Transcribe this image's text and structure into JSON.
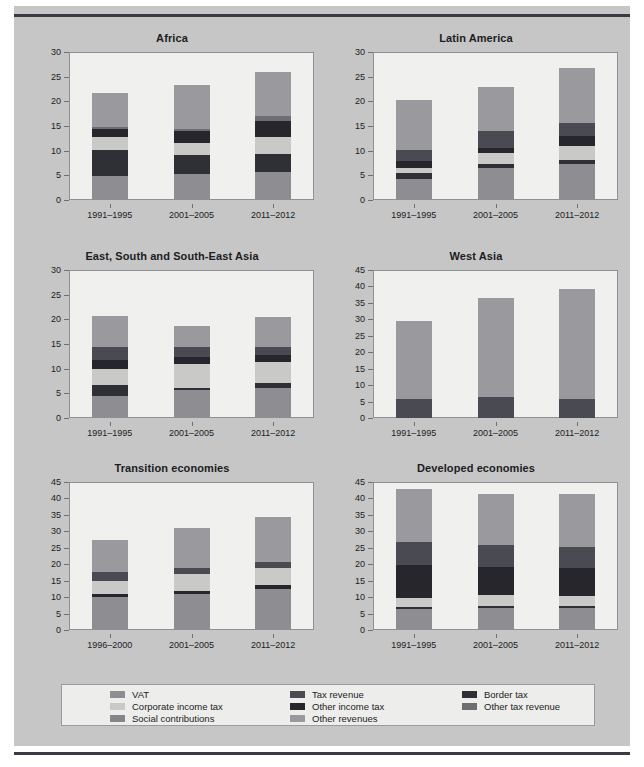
{
  "colors": {
    "page_background": "#c6c6c6",
    "plot_background": "#f0f0ee",
    "legend_background": "#ededeb",
    "rule": "#3b3b45",
    "vat": "#8e8e92",
    "corporate_income_tax": "#c9c9c7",
    "social_contributions": "#84848a",
    "tax_revenue": "#4a4a52",
    "other_income_tax": "#26262c",
    "other_revenues": "#9a9a9e",
    "border_tax": "#2f2f36",
    "other_tax_revenue": "#6d6d74"
  },
  "legend": {
    "columns": [
      [
        {
          "label": "VAT",
          "key": "vat"
        },
        {
          "label": "Corporate income tax",
          "key": "corporate_income_tax"
        },
        {
          "label": "Social contributions",
          "key": "social_contributions"
        }
      ],
      [
        {
          "label": "Tax revenue",
          "key": "tax_revenue"
        },
        {
          "label": "Other income tax",
          "key": "other_income_tax"
        },
        {
          "label": "Other revenues",
          "key": "other_revenues"
        }
      ],
      [
        {
          "label": "Border tax",
          "key": "border_tax"
        },
        {
          "label": "Other tax revenue",
          "key": "other_tax_revenue"
        }
      ]
    ]
  },
  "chart_data": [
    {
      "type": "bar",
      "stacked": true,
      "title": "Africa",
      "xlabel": "",
      "ylabel": "",
      "ylim": [
        0,
        30
      ],
      "yticks": [
        0,
        5,
        10,
        15,
        20,
        25,
        30
      ],
      "grid": false,
      "categories": [
        "1991–1995",
        "2001–2005",
        "2011–2012"
      ],
      "series": [
        {
          "name": "VAT",
          "key": "vat",
          "values": [
            4.8,
            5.2,
            5.6
          ]
        },
        {
          "name": "Border tax",
          "key": "border_tax",
          "values": [
            5.3,
            4.0,
            3.8
          ]
        },
        {
          "name": "Corporate income tax",
          "key": "corporate_income_tax",
          "values": [
            2.7,
            2.4,
            3.4
          ]
        },
        {
          "name": "Other income tax",
          "key": "other_income_tax",
          "values": [
            1.5,
            2.3,
            3.2
          ]
        },
        {
          "name": "Other tax revenue",
          "key": "other_tax_revenue",
          "values": [
            0.5,
            0.6,
            1.0
          ]
        },
        {
          "name": "Other revenues",
          "key": "other_revenues",
          "values": [
            7.0,
            8.8,
            9.0
          ]
        }
      ],
      "totals": [
        21.8,
        23.3,
        26.0
      ]
    },
    {
      "type": "bar",
      "stacked": true,
      "title": "Latin America",
      "xlabel": "",
      "ylabel": "",
      "ylim": [
        0,
        30
      ],
      "yticks": [
        0,
        5,
        10,
        15,
        20,
        25,
        30
      ],
      "grid": false,
      "categories": [
        "1991–1995",
        "2001–2005",
        "2011–2012"
      ],
      "series": [
        {
          "name": "VAT",
          "key": "vat",
          "values": [
            4.3,
            6.5,
            7.2
          ]
        },
        {
          "name": "Border tax",
          "key": "border_tax",
          "values": [
            1.2,
            0.8,
            0.9
          ]
        },
        {
          "name": "Corporate income tax",
          "key": "corporate_income_tax",
          "values": [
            1.0,
            2.2,
            2.8
          ]
        },
        {
          "name": "Other income tax",
          "key": "other_income_tax",
          "values": [
            1.5,
            1.0,
            2.0
          ]
        },
        {
          "name": "Tax revenue",
          "key": "tax_revenue",
          "values": [
            2.2,
            3.5,
            2.8
          ]
        },
        {
          "name": "Other revenues",
          "key": "other_revenues",
          "values": [
            10.0,
            9.0,
            11.1
          ]
        }
      ],
      "totals": [
        20.2,
        23.0,
        26.8
      ]
    },
    {
      "type": "bar",
      "stacked": true,
      "title": "East, South and South-East Asia",
      "xlabel": "",
      "ylabel": "",
      "ylim": [
        0,
        30
      ],
      "yticks": [
        0,
        5,
        10,
        15,
        20,
        25,
        30
      ],
      "grid": false,
      "categories": [
        "1991–1995",
        "2001–2005",
        "2011–2012"
      ],
      "series": [
        {
          "name": "VAT",
          "key": "vat",
          "values": [
            4.4,
            5.6,
            6.0
          ]
        },
        {
          "name": "Border tax",
          "key": "border_tax",
          "values": [
            2.2,
            0.5,
            1.0
          ]
        },
        {
          "name": "Corporate income tax",
          "key": "corporate_income_tax",
          "values": [
            3.4,
            4.8,
            4.4
          ]
        },
        {
          "name": "Other income tax",
          "key": "other_income_tax",
          "values": [
            1.7,
            1.5,
            1.3
          ]
        },
        {
          "name": "Tax revenue",
          "key": "tax_revenue",
          "values": [
            2.7,
            2.0,
            1.6
          ]
        },
        {
          "name": "Other revenues",
          "key": "other_revenues",
          "values": [
            6.3,
            4.3,
            6.2
          ]
        }
      ],
      "totals": [
        20.7,
        18.7,
        20.5
      ]
    },
    {
      "type": "bar",
      "stacked": true,
      "title": "West Asia",
      "xlabel": "",
      "ylabel": "",
      "ylim": [
        0,
        45
      ],
      "yticks": [
        0,
        5,
        10,
        15,
        20,
        25,
        30,
        35,
        40,
        45
      ],
      "grid": false,
      "categories": [
        "1991–1995",
        "2001–2005",
        "2011–2012"
      ],
      "series": [
        {
          "name": "Tax revenue",
          "key": "tax_revenue",
          "values": [
            5.9,
            6.4,
            5.9
          ]
        },
        {
          "name": "Other revenues",
          "key": "other_revenues",
          "values": [
            23.5,
            30.2,
            33.2
          ]
        }
      ],
      "totals": [
        29.4,
        36.6,
        39.1
      ]
    },
    {
      "type": "bar",
      "stacked": true,
      "title": "Transition economies",
      "xlabel": "",
      "ylabel": "",
      "ylim": [
        0,
        45
      ],
      "yticks": [
        0,
        5,
        10,
        15,
        20,
        25,
        30,
        35,
        40,
        45
      ],
      "grid": false,
      "categories": [
        "1996–2000",
        "2001–2005",
        "2011–2012"
      ],
      "series": [
        {
          "name": "VAT",
          "key": "vat",
          "values": [
            10.1,
            10.8,
            12.6
          ]
        },
        {
          "name": "Other income tax",
          "key": "other_income_tax",
          "values": [
            1.0,
            1.2,
            1.1
          ]
        },
        {
          "name": "Corporate income tax",
          "key": "corporate_income_tax",
          "values": [
            3.9,
            5.0,
            5.1
          ]
        },
        {
          "name": "Tax revenue",
          "key": "tax_revenue",
          "values": [
            2.8,
            1.9,
            2.0
          ]
        },
        {
          "name": "Other revenues",
          "key": "other_revenues",
          "values": [
            9.5,
            12.1,
            13.5
          ]
        }
      ],
      "totals": [
        27.3,
        31.0,
        34.3
      ]
    },
    {
      "type": "bar",
      "stacked": true,
      "title": "Developed economies",
      "xlabel": "",
      "ylabel": "",
      "ylim": [
        0,
        45
      ],
      "yticks": [
        0,
        5,
        10,
        15,
        20,
        25,
        30,
        35,
        40,
        45
      ],
      "grid": false,
      "categories": [
        "1991–1995",
        "2001–2005",
        "2011–2012"
      ],
      "series": [
        {
          "name": "VAT",
          "key": "vat",
          "values": [
            6.4,
            6.8,
            6.8
          ]
        },
        {
          "name": "Border tax",
          "key": "border_tax",
          "values": [
            0.6,
            0.5,
            0.5
          ]
        },
        {
          "name": "Corporate income tax",
          "key": "corporate_income_tax",
          "values": [
            2.7,
            3.5,
            3.1
          ]
        },
        {
          "name": "Other income tax",
          "key": "other_income_tax",
          "values": [
            10.2,
            8.5,
            8.6
          ]
        },
        {
          "name": "Tax revenue",
          "key": "tax_revenue",
          "values": [
            6.8,
            6.5,
            6.2
          ]
        },
        {
          "name": "Other revenues",
          "key": "other_revenues",
          "values": [
            16.3,
            15.7,
            16.3
          ]
        }
      ],
      "totals": [
        43.0,
        41.5,
        41.5
      ]
    }
  ]
}
